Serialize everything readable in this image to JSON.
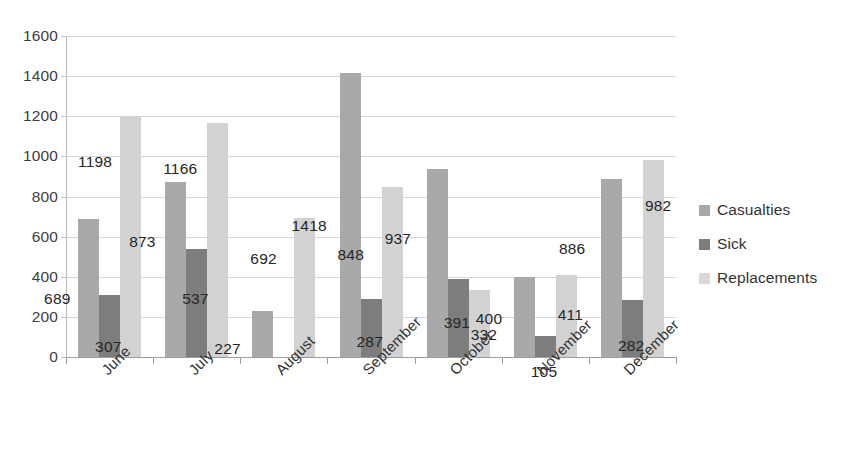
{
  "chart_data": {
    "type": "bar",
    "title": "",
    "subtitle": "",
    "xlabel": "",
    "ylabel": "",
    "ylim": [
      0,
      1600
    ],
    "ytick_step": 200,
    "yticks": [
      "1600",
      "1400",
      "1200",
      "1000",
      "800",
      "600",
      "400",
      "200",
      "0"
    ],
    "grid": true,
    "legend_position": "right",
    "categories": [
      "June",
      "July",
      "August",
      "September",
      "October",
      "November",
      "December"
    ],
    "series": [
      {
        "name": "Casualties",
        "color": "#a9a9a9",
        "values": [
          689,
          873,
          227,
          1418,
          937,
          400,
          886
        ],
        "labels": [
          "689",
          "873",
          "227",
          "1418",
          "937",
          "400",
          "886"
        ]
      },
      {
        "name": "Sick",
        "color": "#7d7d7d",
        "values": [
          307,
          537,
          null,
          287,
          391,
          105,
          282
        ],
        "labels": [
          "307",
          "537",
          "",
          "287",
          "391",
          "105",
          "282"
        ]
      },
      {
        "name": "Replacements",
        "color": "#d2d2d2",
        "values": [
          1198,
          1166,
          692,
          848,
          332,
          411,
          982
        ],
        "labels": [
          "1198",
          "1166",
          "692",
          "848",
          "332",
          "411",
          "982"
        ]
      }
    ]
  },
  "legend": {
    "items": [
      {
        "label": "Casualties",
        "color": "#a9a9a9"
      },
      {
        "label": "Sick",
        "color": "#7d7d7d"
      },
      {
        "label": "Replacements",
        "color": "#d8d8d8"
      }
    ]
  }
}
